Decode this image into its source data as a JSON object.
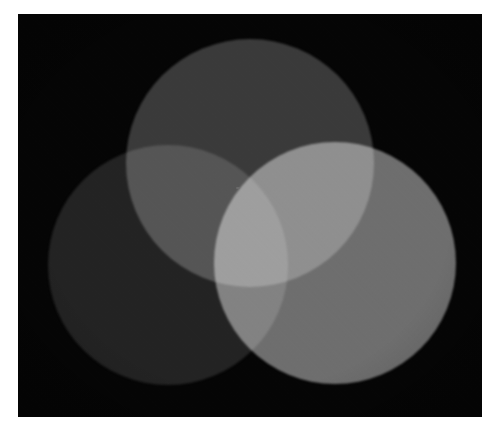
{
  "figure": {
    "caption": "",
    "background_color": "#ffffff",
    "plate_color": "#050505",
    "plate": {
      "x": 18,
      "y": 14,
      "width": 464,
      "height": 403
    }
  },
  "chart_data": {
    "type": "diagram",
    "subtype": "three-circle-venn-additive-light",
    "xlabel": "",
    "ylabel": "",
    "grid": false,
    "legend_position": "none",
    "colorspace": "grayscale",
    "blend_mode": "screen",
    "canvas": {
      "width": 464,
      "height": 403,
      "background": "#050505"
    },
    "circles": [
      {
        "id": "top",
        "label": "Top source",
        "channel": "red",
        "cx": 232,
        "cy": 149,
        "r": 124,
        "fill": "#3a3a3a",
        "gray_level": 58
      },
      {
        "id": "left",
        "label": "Left source",
        "channel": "blue",
        "cx": 150,
        "cy": 251,
        "r": 120,
        "fill": "#232323",
        "gray_level": 35
      },
      {
        "id": "right",
        "label": "Right source",
        "channel": "green",
        "cx": 317,
        "cy": 249,
        "r": 121,
        "fill": "#6e6e6e",
        "gray_level": 110
      }
    ],
    "regions": [
      {
        "id": "top-only",
        "members": [
          "top"
        ],
        "fill": "#3a3a3a",
        "gray_level": 58
      },
      {
        "id": "left-only",
        "members": [
          "left"
        ],
        "fill": "#232323",
        "gray_level": 35
      },
      {
        "id": "right-only",
        "members": [
          "right"
        ],
        "fill": "#6e6e6e",
        "gray_level": 110
      },
      {
        "id": "top-left",
        "members": [
          "top",
          "left"
        ],
        "fill": "#5c5c5c",
        "gray_level": 92
      },
      {
        "id": "top-right",
        "members": [
          "top",
          "right"
        ],
        "fill": "#d8d8d8",
        "gray_level": 216
      },
      {
        "id": "left-right",
        "members": [
          "left",
          "right"
        ],
        "fill": "#8a8a8a",
        "gray_level": 138
      },
      {
        "id": "all-three-center",
        "members": [
          "top",
          "left",
          "right"
        ],
        "fill": "#fcfcfc",
        "gray_level": 252
      },
      {
        "id": "background",
        "members": [],
        "fill": "#050505",
        "gray_level": 5
      }
    ],
    "artifacts": [
      {
        "id": "dust-speck",
        "x": 218,
        "y": 173,
        "width": 4,
        "height": 2,
        "fill": "#6d6d6d"
      }
    ],
    "effects": {
      "grain_opacity": 0.22,
      "edge_blur_px": 1.2,
      "vignette": true
    }
  }
}
